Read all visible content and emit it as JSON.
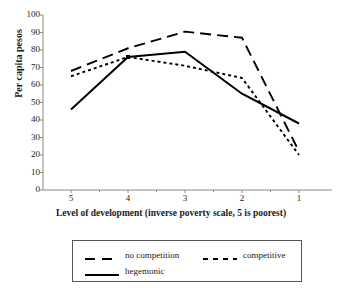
{
  "chart_data": {
    "type": "line",
    "title": "",
    "subtitle": "",
    "xlabel": "Level of development (inverse poverty scale, 5 is poorest)",
    "ylabel": "Per capita pesos",
    "categories": [
      "5",
      "4",
      "3",
      "2",
      "1"
    ],
    "x_tick_labels": [
      "5",
      "4",
      "3",
      "2",
      "1"
    ],
    "y_tick_labels": [
      "100",
      "90",
      "80",
      "70",
      "60",
      "50",
      "40",
      "30",
      "20",
      "10",
      "0"
    ],
    "y_ticks": [
      100,
      90,
      80,
      70,
      60,
      50,
      40,
      30,
      20,
      10,
      0
    ],
    "ylim": [
      0,
      100
    ],
    "grid": false,
    "legend_position": "bottom",
    "series": [
      {
        "name": "no competition",
        "style": "long-dash",
        "color": "#000000",
        "values": [
          68,
          81,
          90.5,
          87,
          22
        ]
      },
      {
        "name": "competitive",
        "style": "short-dash",
        "color": "#000000",
        "values": [
          65,
          76,
          71,
          64,
          20
        ]
      },
      {
        "name": "hegemonic",
        "style": "solid",
        "color": "#000000",
        "values": [
          46,
          76,
          79,
          55,
          38
        ]
      }
    ]
  },
  "legend": {
    "entries": [
      {
        "label": "no competition",
        "style": "long-dash"
      },
      {
        "label": "competitive",
        "style": "short-dash"
      },
      {
        "label": "hegemonic",
        "style": "solid"
      }
    ]
  },
  "axes": {
    "y_title": "Per capita pesos",
    "x_title": "Level of development (inverse poverty scale, 5 is poorest)"
  },
  "colors": {
    "line": "#000000",
    "axis": "#808080",
    "legend_border": "#555555",
    "background": "#ffffff"
  }
}
